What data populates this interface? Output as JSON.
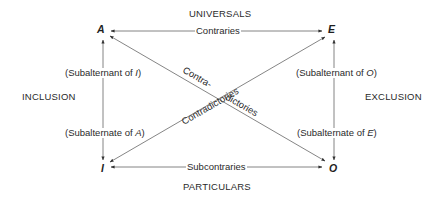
{
  "diagram": {
    "colors": {
      "line": "#555555",
      "text": "#222222",
      "background": "#ffffff"
    },
    "headers": {
      "top": "UNIVERSALS",
      "bottom": "PARTICULARS",
      "left": "INCLUSION",
      "right": "EXCLUSION"
    },
    "corners": {
      "A": "A",
      "E": "E",
      "I": "I",
      "O": "O"
    },
    "relations": {
      "top_edge": "Contraries",
      "bottom_edge": "Subcontraries",
      "diagonal_A_O_part1": "Contra-",
      "diagonal_A_O_part2": "dictories",
      "diagonal_I_E": "Contradictories"
    },
    "side_labels": {
      "left_upper_prefix": "(Subalternant of ",
      "left_upper_letter": "I",
      "left_upper_suffix": ")",
      "left_lower_prefix": "(Subalternate of ",
      "left_lower_letter": "A",
      "left_lower_suffix": ")",
      "right_upper_prefix": "(Subalternant of ",
      "right_upper_letter": "O",
      "right_upper_suffix": ")",
      "right_lower_prefix": "(Subalternate of ",
      "right_lower_letter": "E",
      "right_lower_suffix": ")"
    }
  }
}
